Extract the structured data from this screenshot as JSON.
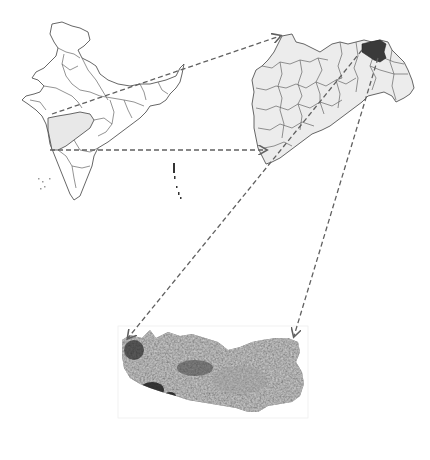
{
  "figure": {
    "type": "study-area location map",
    "panels": [
      {
        "id": "country-map",
        "name": "India",
        "highlighted_region": "Maharashtra",
        "highlight_color": "#e8e8e8"
      },
      {
        "id": "state-map",
        "name": "Maharashtra",
        "highlighted_region": "study district",
        "highlight_color": "#3a3a3a",
        "fill_color": "#ececec"
      },
      {
        "id": "district-image",
        "name": "study area satellite image",
        "tone": "grayscale"
      }
    ],
    "arrows": [
      {
        "from": "country-map",
        "to": "state-map",
        "style": "dashed"
      },
      {
        "from": "country-map",
        "to": "state-map",
        "style": "dashed"
      },
      {
        "from": "state-map",
        "to": "district-image",
        "style": "dashed"
      },
      {
        "from": "state-map",
        "to": "district-image",
        "style": "dashed"
      }
    ],
    "colors": {
      "outline": "#555555",
      "arrow": "#606060",
      "background": "#ffffff"
    }
  }
}
